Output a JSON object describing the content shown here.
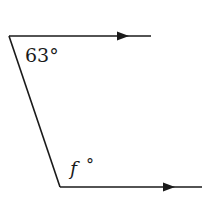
{
  "diagram": {
    "type": "parallel-lines-transversal",
    "angles": {
      "top": {
        "value": "63",
        "unit": "°",
        "text": "63°"
      },
      "bottom": {
        "variable": "f",
        "unit": "°",
        "text_var": "f",
        "text_deg": "°"
      }
    },
    "colors": {
      "stroke": "#1a1a1a",
      "background": "#ffffff"
    }
  }
}
